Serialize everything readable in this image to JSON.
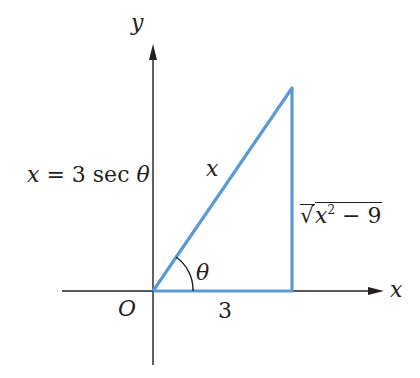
{
  "diagram": {
    "type": "right-triangle-trig-substitution",
    "axes": {
      "x_label": "x",
      "y_label": "y",
      "origin_label": "O"
    },
    "equation": "x = 3 sec θ",
    "hypotenuse_label": "x",
    "adjacent_label": "3",
    "opposite_label": "√(x² − 9)",
    "angle_label": "θ",
    "colors": {
      "triangle": "#5b9bd5",
      "axes": "#231f20",
      "text": "#231f20"
    }
  },
  "labels": {
    "y": "y",
    "x": "x",
    "origin": "O",
    "equation": "x = 3 sec θ",
    "hyp": "x",
    "adj": "3",
    "theta": "θ",
    "sqrt_symbol": "√",
    "opp_var": "x",
    "opp_exp": "2",
    "opp_rest": " − 9"
  }
}
